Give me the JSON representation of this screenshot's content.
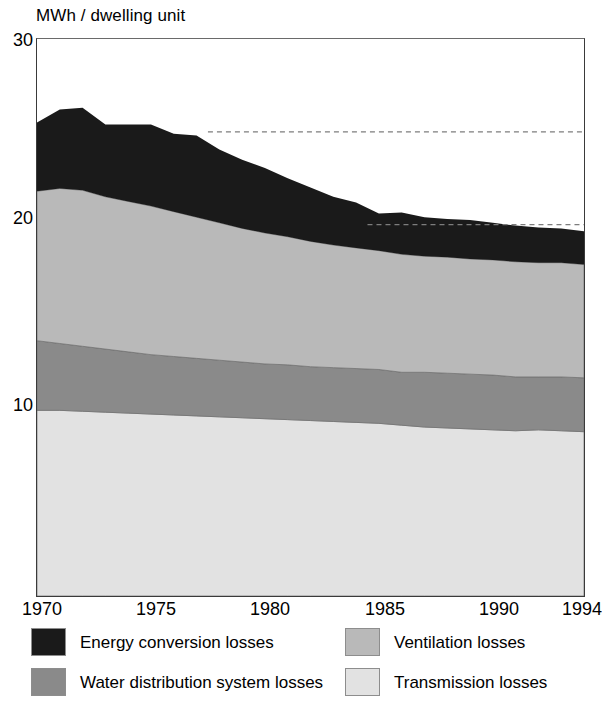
{
  "chart_data": {
    "type": "area",
    "stacked": true,
    "title": "",
    "subtitle": "",
    "xlabel": "",
    "ylabel": "MWh / dwelling unit",
    "y_unit_caption": "MWh / dwelling unit",
    "xlim": [
      1970,
      1994
    ],
    "ylim": [
      0,
      30
    ],
    "yticks": [
      10,
      20,
      30
    ],
    "ytick_labels": [
      "10",
      "20",
      "30"
    ],
    "xticks": [
      1970,
      1975,
      1980,
      1985,
      1990,
      1994
    ],
    "xtick_labels": [
      "1970",
      "1975",
      "1980",
      "1985",
      "1990",
      "1994"
    ],
    "grid": false,
    "legend_position": "bottom",
    "reference_lines": [
      {
        "value": 25,
        "style": "dashed",
        "x_start": 1977.5,
        "x_end": 1994
      },
      {
        "value": 20,
        "style": "dashed",
        "x_start": 1984.5,
        "x_end": 1994
      }
    ],
    "x": [
      1970,
      1971,
      1972,
      1973,
      1974,
      1975,
      1976,
      1977,
      1978,
      1979,
      1980,
      1981,
      1982,
      1983,
      1984,
      1985,
      1986,
      1987,
      1988,
      1989,
      1990,
      1991,
      1992,
      1993,
      1994
    ],
    "series": [
      {
        "name": "Transmission losses",
        "color": "#e2e2e2",
        "values": [
          10.0,
          10.0,
          9.95,
          9.9,
          9.85,
          9.8,
          9.75,
          9.7,
          9.65,
          9.6,
          9.55,
          9.5,
          9.45,
          9.4,
          9.35,
          9.3,
          9.2,
          9.1,
          9.05,
          9.0,
          8.95,
          8.9,
          8.95,
          8.9,
          8.85
        ]
      },
      {
        "name": "Water distribution system losses",
        "color": "#8a8a8a",
        "values": [
          3.75,
          3.6,
          3.5,
          3.4,
          3.3,
          3.2,
          3.15,
          3.1,
          3.05,
          3.0,
          2.95,
          2.95,
          2.9,
          2.9,
          2.9,
          2.9,
          2.85,
          2.95,
          2.95,
          2.95,
          2.95,
          2.9,
          2.85,
          2.9,
          2.9
        ]
      },
      {
        "name": "Ventilation losses",
        "color": "#b9b9b9",
        "values": [
          8.05,
          8.35,
          8.4,
          8.2,
          8.1,
          8.0,
          7.8,
          7.6,
          7.4,
          7.2,
          7.05,
          6.9,
          6.75,
          6.6,
          6.5,
          6.4,
          6.35,
          6.25,
          6.25,
          6.2,
          6.2,
          6.2,
          6.15,
          6.15,
          6.1
        ]
      },
      {
        "name": "Energy conversion losses",
        "color": "#1a1a1a",
        "values": [
          3.7,
          4.25,
          4.45,
          3.9,
          4.15,
          4.4,
          4.2,
          4.4,
          3.95,
          3.7,
          3.5,
          3.15,
          2.9,
          2.6,
          2.45,
          2.0,
          2.25,
          2.1,
          2.05,
          2.1,
          2.0,
          1.95,
          1.9,
          1.85,
          1.8
        ]
      }
    ],
    "totals": [
      25.5,
      26.2,
      26.3,
      25.4,
      25.4,
      25.4,
      24.9,
      24.8,
      24.05,
      23.5,
      23.05,
      22.5,
      22.0,
      21.5,
      21.2,
      20.6,
      20.65,
      20.4,
      20.3,
      20.25,
      20.1,
      19.95,
      19.85,
      19.8,
      19.65
    ]
  },
  "legend": {
    "items": [
      {
        "label": "Energy conversion losses",
        "color": "#1a1a1a"
      },
      {
        "label": "Water distribution system losses",
        "color": "#8a8a8a"
      },
      {
        "label": "Ventilation losses",
        "color": "#b9b9b9"
      },
      {
        "label": "Transmission losses",
        "color": "#e2e2e2"
      }
    ]
  }
}
